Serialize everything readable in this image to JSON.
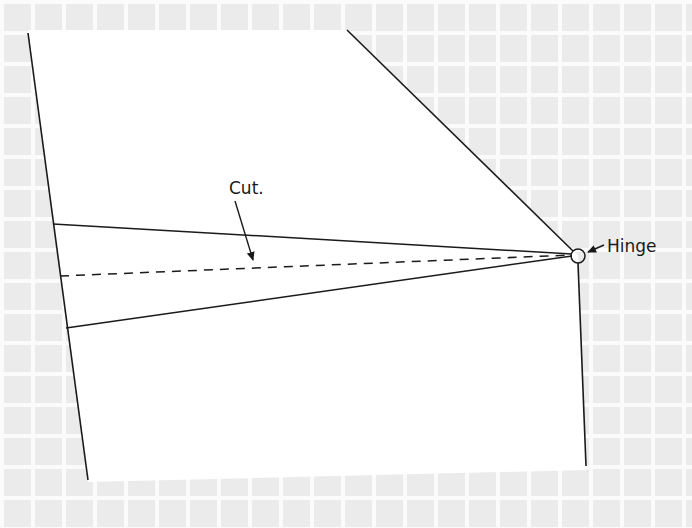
{
  "diagram": {
    "type": "geometric-sketch",
    "background": {
      "pattern": "grid",
      "cell_px": 31,
      "cell_color": "#ebebeb",
      "gap_color": "#fbfbfb"
    },
    "paper": {
      "fill": "#ffffff",
      "stroke": "#1a1a1a"
    },
    "labels": {
      "cut": "Cut.",
      "hinge": "Hinge"
    },
    "elements": [
      {
        "id": "left-edge",
        "kind": "line",
        "from": [
          28,
          33
        ],
        "to": [
          88,
          480
        ]
      },
      {
        "id": "top-right-edge",
        "kind": "line",
        "from": [
          347,
          30
        ],
        "to": [
          578,
          255
        ]
      },
      {
        "id": "right-edge",
        "kind": "line",
        "from": [
          578,
          262
        ],
        "to": [
          586,
          466
        ]
      },
      {
        "id": "upper-cut-line",
        "kind": "line",
        "from": [
          53,
          224
        ],
        "to": [
          572,
          254
        ]
      },
      {
        "id": "center-dashed-line",
        "kind": "dashed-line",
        "from": [
          60,
          276
        ],
        "to": [
          572,
          255
        ]
      },
      {
        "id": "lower-cut-line",
        "kind": "line",
        "from": [
          66,
          328
        ],
        "to": [
          572,
          256
        ]
      },
      {
        "id": "hinge-circle",
        "kind": "circle",
        "center": [
          578,
          256
        ],
        "r": 7
      },
      {
        "id": "cut-arrow",
        "kind": "arrow",
        "from": [
          235,
          201
        ],
        "to": [
          254,
          262
        ]
      },
      {
        "id": "hinge-arrow",
        "kind": "arrow",
        "from": [
          604,
          245
        ],
        "to": [
          587,
          252
        ]
      }
    ]
  }
}
